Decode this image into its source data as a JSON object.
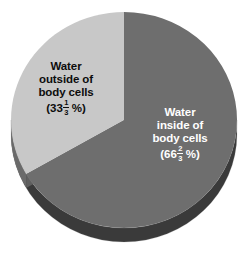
{
  "figure": {
    "kind": "3d-pie-chart",
    "background_color": "#ffffff",
    "width": 249,
    "height": 257
  },
  "chart_data": {
    "type": "pie",
    "title": "",
    "xlabel": "",
    "ylabel": "",
    "legend_position": "none",
    "grid": false,
    "three_d": true,
    "start_angle_deg": 0,
    "direction": "clockwise",
    "categories": [
      "Water inside of body cells",
      "Water outside of body cells"
    ],
    "values": [
      66.6667,
      33.3333
    ],
    "value_display": [
      "66 2/3 %",
      "33 1/3 %"
    ],
    "colors": [
      "#6e6e6e",
      "#c8c8c8"
    ],
    "slices": [
      {
        "id": "inside",
        "name": "Water inside of body cells",
        "value": 66.6667,
        "fraction_text": "66 2/3 %",
        "whole": "66",
        "numerator": "2",
        "denominator": "3",
        "percent_sign": "%",
        "open_paren": "(",
        "close_paren": ")",
        "color": "#6e6e6e",
        "side_color": "#3a3a3a",
        "label_color": "#ffffff",
        "label_lines": [
          "Water",
          "inside of",
          "body cells"
        ],
        "start_angle_deg": 0,
        "sweep_deg": 240
      },
      {
        "id": "outside",
        "name": "Water outside of body cells",
        "value": 33.3333,
        "fraction_text": "33 1/3 %",
        "whole": "33",
        "numerator": "1",
        "denominator": "3",
        "percent_sign": "%",
        "open_paren": "(",
        "close_paren": ")",
        "color": "#c8c8c8",
        "side_color": "#6a6a6a",
        "label_color": "#0d0d0d",
        "label_lines": [
          "Water",
          "outside of",
          "body cells"
        ],
        "start_angle_deg": 240,
        "sweep_deg": 120
      }
    ]
  },
  "labels": {
    "outside": {
      "line1": "Water",
      "line2": "outside of",
      "line3": "body cells",
      "open_paren": "(",
      "whole": "33",
      "numerator": "1",
      "denominator": "3",
      "percent": "%",
      "close_paren": ")"
    },
    "inside": {
      "line1": "Water",
      "line2": "inside of",
      "line3": "body cells",
      "open_paren": "(",
      "whole": "66",
      "numerator": "2",
      "denominator": "3",
      "percent": "%",
      "close_paren": ")"
    }
  },
  "colors": {
    "slice_dark_top": "#6e6e6e",
    "slice_dark_side": "#3a3a3a",
    "slice_light_top": "#c8c8c8",
    "slice_light_side": "#6a6a6a",
    "background": "#ffffff"
  }
}
